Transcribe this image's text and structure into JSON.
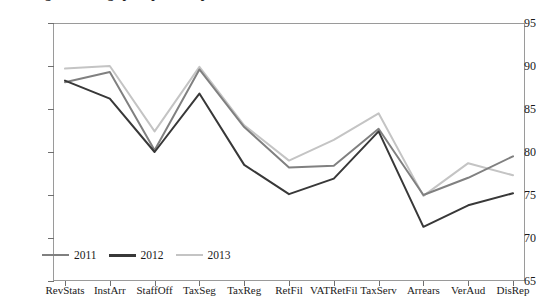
{
  "chart": {
    "title": "Figure: Average perceptions of performance of tax administration",
    "y_axis": {
      "ticks": [
        "95",
        "90",
        "85",
        "80",
        "75",
        "70",
        "65"
      ],
      "min": 65,
      "max": 95,
      "step": 5
    },
    "legend": [
      {
        "label": "2011",
        "color": "#808080"
      },
      {
        "label": "2012",
        "color": "#383838"
      },
      {
        "label": "2013",
        "color": "#c4c4c4"
      }
    ]
  },
  "chart_data": {
    "type": "line",
    "title": "Figure: Average perceptions of performance of tax administration",
    "xlabel": "",
    "ylabel": "",
    "ylim": [
      65,
      95
    ],
    "ytick_step": 5,
    "grid": false,
    "legend_position": "bottom-left",
    "categories": [
      "RevStats",
      "InstArr",
      "StaffOff",
      "TaxSeg",
      "TaxReg",
      "RetFil",
      "VATRetFil",
      "TaxServ",
      "Arrears",
      "VerAud",
      "DisRep"
    ],
    "series": [
      {
        "name": "2011",
        "color": "#808080",
        "values": [
          88.1,
          89.3,
          80.2,
          89.6,
          82.9,
          78.2,
          78.4,
          82.7,
          75.0,
          77.0,
          79.5
        ]
      },
      {
        "name": "2012",
        "color": "#383838",
        "values": [
          88.3,
          86.2,
          80.0,
          86.8,
          78.5,
          75.1,
          76.9,
          82.4,
          71.3,
          73.8,
          75.2
        ]
      },
      {
        "name": "2013",
        "color": "#c4c4c4",
        "values": [
          89.7,
          90.0,
          82.4,
          89.9,
          83.1,
          79.0,
          81.4,
          84.5,
          74.9,
          78.7,
          77.3
        ]
      }
    ]
  }
}
